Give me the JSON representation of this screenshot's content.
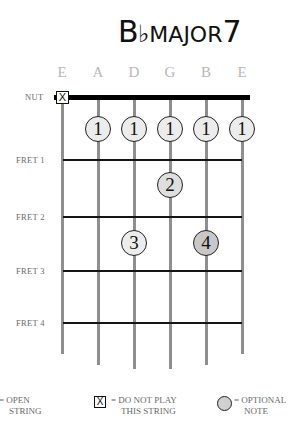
{
  "title": {
    "root": "B",
    "accidental": "♭",
    "quality": "MAJOR",
    "extension": "7"
  },
  "strings": [
    {
      "name": "E",
      "x": 62
    },
    {
      "name": "A",
      "x": 98
    },
    {
      "name": "D",
      "x": 134
    },
    {
      "name": "G",
      "x": 170
    },
    {
      "name": "B",
      "x": 206
    },
    {
      "name": "E",
      "x": 242
    }
  ],
  "labels": {
    "nut": "NUT",
    "fret1": "FRET 1",
    "fret2": "FRET 2",
    "fret3": "FRET 3",
    "fret4": "FRET 4"
  },
  "muted_marker": "X",
  "fingers": [
    {
      "string": "A",
      "fret": 1,
      "finger": "1"
    },
    {
      "string": "D",
      "fret": 1,
      "finger": "1"
    },
    {
      "string": "G",
      "fret": 1,
      "finger": "1"
    },
    {
      "string": "B",
      "fret": 1,
      "finger": "1"
    },
    {
      "string": "E",
      "fret": 1,
      "finger": "1"
    },
    {
      "string": "G",
      "fret": 2,
      "finger": "2"
    },
    {
      "string": "D",
      "fret": 3,
      "finger": "3"
    },
    {
      "string": "B",
      "fret": 3,
      "finger": "4",
      "optional": true
    }
  ],
  "legend": {
    "open": {
      "line1": "= OPEN",
      "line2": "STRING"
    },
    "mute": {
      "symbol": "X",
      "line1": "= DO NOT PLAY",
      "line2": "THIS STRING"
    },
    "optional": {
      "line1": "= OPTIONAL",
      "line2": "NOTE"
    }
  },
  "colors": {
    "string": "#8f8f8f",
    "fret": "#151515",
    "dot_fill": "#ececec",
    "optional_fill": "#c8c8c8",
    "label": "#6a6a6a",
    "string_name": "#b8b8b8"
  }
}
